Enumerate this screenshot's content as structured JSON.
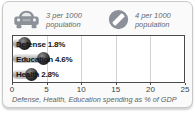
{
  "legend": {
    "items": [
      {
        "icon": "car-icon",
        "line1": "3 per 1000",
        "line2": "population"
      },
      {
        "icon": "telephone-icon",
        "line1": "4 per 1000",
        "line2": "population"
      }
    ]
  },
  "chart_data": {
    "type": "bar",
    "orientation": "horizontal",
    "categories": [
      "Defense",
      "Education",
      "Health"
    ],
    "values": [
      1.8,
      4.6,
      2.8
    ],
    "value_labels": [
      "1.8%",
      "4.6%",
      "2.8%"
    ],
    "xlim": [
      0,
      25
    ],
    "xticks": [
      "0",
      "5",
      "10",
      "15",
      "20",
      "25"
    ],
    "grid": true,
    "legend_position": "top",
    "caption": "Defense, Health, Education spending as % of GDP"
  },
  "colors": {
    "card_bg": "#fafafa",
    "card_border": "#c9c9c9",
    "plot_bg": "#ffffff",
    "plot_border": "#4a4a4a",
    "gridline": "#d2d2d2",
    "bar_body": "#b5b5b5",
    "bar_cap": "#0c0c0c",
    "label_text": "#10161e",
    "tick_text": "#3f3f3f",
    "caption_text": "#5d6268",
    "icon_gray": "#8b9099"
  }
}
